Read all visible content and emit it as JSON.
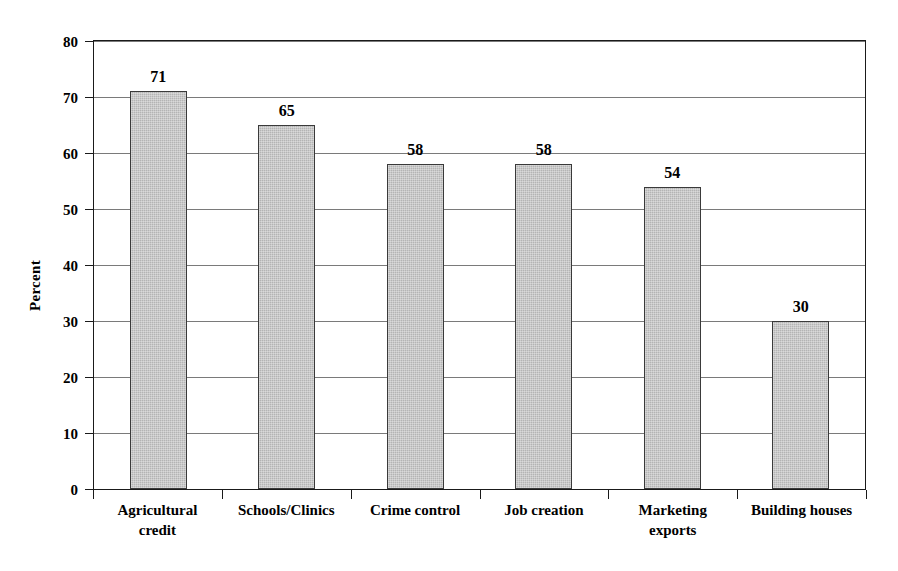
{
  "chart_data": {
    "type": "bar",
    "title": "",
    "subtitle": "",
    "xlabel": "",
    "ylabel": "Percent",
    "categories": [
      "Agricultural credit",
      "Schools/Clinics",
      "Crime control",
      "Job creation",
      "Marketing exports",
      "Building houses"
    ],
    "category_lines": [
      [
        "Agricultural",
        "credit"
      ],
      [
        "Schools/Clinics"
      ],
      [
        "Crime control"
      ],
      [
        "Job creation"
      ],
      [
        "Marketing",
        "exports"
      ],
      [
        "Building houses"
      ]
    ],
    "values": [
      71,
      65,
      58,
      58,
      54,
      30
    ],
    "value_labels": [
      "71",
      "65",
      "58",
      "58",
      "54",
      "30"
    ],
    "ylim": [
      0,
      80
    ],
    "ytick_values": [
      0,
      10,
      20,
      30,
      40,
      50,
      60,
      70,
      80
    ],
    "ytick_labels": [
      "0",
      "10",
      "20",
      "30",
      "40",
      "50",
      "60",
      "70",
      "80"
    ],
    "grid": true,
    "grid_axis": "y",
    "legend": false,
    "legend_position": "none",
    "bar_fill_color": "#b4b4b4",
    "bar_border_color": "#3a3a3a",
    "gridline_color": "#7a7a7a",
    "axis_color": "#1a1a1a",
    "background_color": "#ffffff"
  }
}
